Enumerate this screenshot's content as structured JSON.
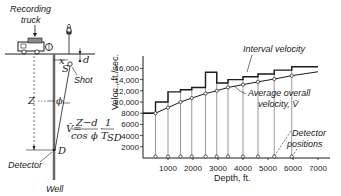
{
  "left_diagram": {
    "labels": {
      "recording_truck_line1": "Recording",
      "recording_truck_line2": "truck",
      "shot": "Shot",
      "detector": "Detector",
      "well": "Well",
      "x": "x",
      "S": "S",
      "d": "d",
      "Z": "Z",
      "phi": "ϕ",
      "D": "D"
    },
    "formula": {
      "lhs": "V̄=",
      "num1": "Z−d",
      "den1": "cos ϕ",
      "dot": "·",
      "num2": "1",
      "den2": "T",
      "den2_sub": "SD"
    }
  },
  "chart_data": {
    "type": "line",
    "title": "",
    "xlabel": "Depth, ft.",
    "ylabel": "Veloc., ft./sec.",
    "xlim": [
      0,
      7500
    ],
    "ylim": [
      0,
      17000
    ],
    "x_ticks": [
      "1000",
      "2000",
      "3000",
      "4000",
      "5000",
      "6000",
      "7000"
    ],
    "y_ticks": [
      "2000",
      "4000",
      "6000",
      "8000",
      "10,000",
      "12,000",
      "14,000",
      "16,000"
    ],
    "grid": false,
    "detector_positions_ft": [
      500,
      1000,
      1500,
      1950,
      2500,
      2950,
      3400,
      4000,
      4600,
      5250,
      5950
    ],
    "series": [
      {
        "name": "Interval velocity",
        "style": "step",
        "x_edges": [
          0,
          500,
          1000,
          1500,
          1950,
          2500,
          2950,
          3400,
          4000,
          4600,
          5250,
          5950,
          7000
        ],
        "values": [
          8000,
          10000,
          11800,
          12200,
          12600,
          15300,
          13400,
          14000,
          14500,
          15000,
          15700,
          16300
        ]
      },
      {
        "name": "Average overall velocity, V̄",
        "style": "line-with-markers",
        "x": [
          0,
          500,
          1000,
          1500,
          1950,
          2500,
          2950,
          3400,
          4000,
          4600,
          5250,
          5950,
          7000
        ],
        "values": [
          8000,
          8000,
          9000,
          10000,
          10700,
          11500,
          12000,
          12600,
          13100,
          13600,
          14100,
          14700,
          15400
        ]
      }
    ],
    "annotations": [
      "Interval velocity",
      "Average overall",
      "velocity, V̄",
      "Detector",
      "positions"
    ]
  }
}
